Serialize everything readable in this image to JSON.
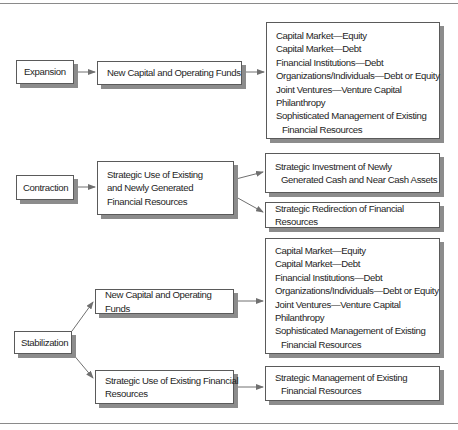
{
  "diagram": {
    "stages": [
      {
        "label": "Expansion",
        "strategy": "New Capital and Operating Funds",
        "outcomes": [
          {
            "lines": [
              "Capital Market—Equity",
              "Capital Market—Debt",
              "Financial Institutions—Debt",
              "Organizations/Individuals—Debt or Equity",
              "Joint Ventures—Venture Capital",
              "Philanthropy",
              "Sophisticated Management of Existing",
              "Financial Resources"
            ]
          }
        ]
      },
      {
        "label": "Contraction",
        "strategy_lines": [
          "Strategic Use of Existing",
          "and Newly Generated",
          "Financial Resources"
        ],
        "outcomes": [
          {
            "lines": [
              "Strategic Investment of Newly",
              "Generated Cash  and Near Cash Assets"
            ]
          },
          {
            "lines": [
              "Strategic Redirection of Financial  Resources"
            ]
          }
        ]
      },
      {
        "label": "Stabilization",
        "branches": [
          {
            "strategy": "New Capital and Operating Funds",
            "outcome_lines": [
              "Capital Market—Equity",
              "Capital Market—Debt",
              "Financial Institutions—Debt",
              "Organizations/Individuals—Debt or Equity",
              "Joint Ventures—Venture Capital",
              "Philanthropy",
              "Sophisticated Management of Existing",
              "Financial Resources"
            ]
          },
          {
            "strategy_lines": [
              "Strategic Use of Existing Financial",
              "Resources"
            ],
            "outcome_lines": [
              "Strategic Management of Existing",
              "Financial Resources"
            ]
          }
        ]
      }
    ]
  },
  "colors": {
    "border": "#5a5a5a",
    "shadow": "#8c8c8c",
    "arrow": "#707070",
    "rule": "#8a8a8a"
  }
}
